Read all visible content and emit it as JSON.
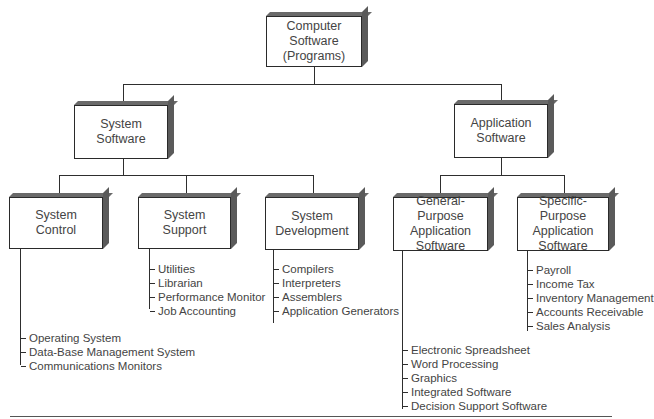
{
  "root": {
    "label": "Computer\nSoftware\n(Programs)"
  },
  "level1": [
    {
      "label": "System\nSoftware"
    },
    {
      "label": "Application\nSoftware"
    }
  ],
  "level2": [
    {
      "label": "System\nControl",
      "items": [
        "Operating System",
        "Data-Base Management System",
        "Communications Monitors"
      ]
    },
    {
      "label": "System\nSupport",
      "items": [
        "Utilities",
        "Librarian",
        "Performance Monitor",
        "Job Accounting"
      ]
    },
    {
      "label": "System\nDevelopment",
      "items": [
        "Compilers",
        "Interpreters",
        "Assemblers",
        "Application Generators"
      ]
    },
    {
      "label": "General-Purpose\nApplication\nSoftware",
      "items": [
        "Electronic Spreadsheet",
        "Word Processing",
        "Graphics",
        "Integrated Software",
        "Decision Support Software"
      ]
    },
    {
      "label": "Specific-Purpose\nApplication\nSoftware",
      "items": [
        "Payroll",
        "Income Tax",
        "Inventory Management",
        "Accounts Receivable",
        "Sales Analysis"
      ]
    }
  ]
}
